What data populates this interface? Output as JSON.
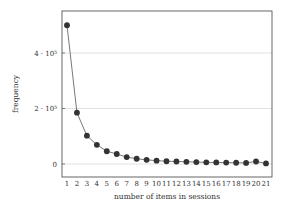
{
  "chart_data": {
    "type": "line",
    "title": "",
    "xlabel": "number of items in sessions",
    "ylabel": "frequency",
    "x": [
      1,
      2,
      3,
      4,
      5,
      6,
      7,
      8,
      9,
      10,
      11,
      12,
      13,
      14,
      15,
      16,
      17,
      18,
      19,
      20,
      21
    ],
    "series": [
      {
        "name": "frequency",
        "values": [
          500000,
          185000,
          102000,
          69000,
          46000,
          36000,
          25000,
          19000,
          15000,
          12000,
          10000,
          9000,
          8000,
          7000,
          6000,
          5500,
          5000,
          4500,
          4000,
          9000,
          2000
        ],
        "color": "#333333",
        "marker": "circle"
      }
    ],
    "yticks": [
      {
        "value": 0,
        "label": "0"
      },
      {
        "value": 200000,
        "label": "2 · 10⁵"
      },
      {
        "value": 400000,
        "label": "4 · 10⁵"
      }
    ],
    "xticks": [
      "1",
      "2",
      "3",
      "4",
      "5",
      "6",
      "7",
      "8",
      "9",
      "10",
      "11",
      "12",
      "13",
      "14",
      "15",
      "16",
      "17",
      "18",
      "19",
      "20",
      "21"
    ],
    "ylim": [
      -45000,
      545000
    ],
    "xlim": [
      0.4,
      21.6
    ],
    "grid": "horizontal",
    "legend": "none"
  }
}
